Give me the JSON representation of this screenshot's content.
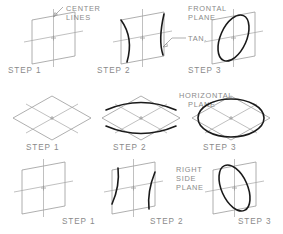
{
  "figure": {
    "type": "technical-drawing",
    "background_color": "#ffffff",
    "construction_line_color": "#9b9b9b",
    "object_line_color": "#1a1a1a",
    "label_color": "#8a8a8a"
  },
  "annotations": {
    "center_lines": "CENTER\nLINES",
    "center_lines_l1": "CENTER",
    "center_lines_l2": "LINES",
    "frontal_plane_l1": "FRONTAL",
    "frontal_plane_l2": "PLANE",
    "tangent": "TAN.",
    "horizontal_plane_l1": "HORIZONTAL",
    "horizontal_plane_l2": "PLANE",
    "right_side_plane_l1": "RIGHT",
    "right_side_plane_l2": "SIDE",
    "right_side_plane_l3": "PLANE"
  },
  "rows": [
    {
      "plane": "Frontal Plane",
      "shape": "rhombus leaning right",
      "ellipse_orientation": "major axis upper-left to lower-right",
      "steps": [
        {
          "label": "STEP 1",
          "content": "isometric square with center lines"
        },
        {
          "label": "STEP 2",
          "content": "two large arcs forming lens"
        },
        {
          "label": "STEP 3",
          "content": "completed ellipse"
        }
      ]
    },
    {
      "plane": "Horizontal Plane",
      "shape": "wide diamond",
      "ellipse_orientation": "major axis horizontal",
      "steps": [
        {
          "label": "STEP 1",
          "content": "isometric square with center lines"
        },
        {
          "label": "STEP 2",
          "content": "top and bottom arcs"
        },
        {
          "label": "STEP 3",
          "content": "completed ellipse"
        }
      ]
    },
    {
      "plane": "Right Side Plane",
      "shape": "rhombus leaning left",
      "ellipse_orientation": "major axis lower-left to upper-right",
      "steps": [
        {
          "label": "STEP 1",
          "content": "isometric square with center lines"
        },
        {
          "label": "STEP 2",
          "content": "two large arcs forming lens"
        },
        {
          "label": "STEP 3",
          "content": "completed ellipse"
        }
      ]
    }
  ],
  "step_labels": {
    "r1s1": "STEP 1",
    "r1s2": "STEP 2",
    "r1s3": "STEP 3",
    "r2s1": "STEP 1",
    "r2s2": "STEP 2",
    "r2s3": "STEP 3",
    "r3s1": "STEP 1",
    "r3s2": "STEP 2",
    "r3s3": "STEP 3"
  }
}
